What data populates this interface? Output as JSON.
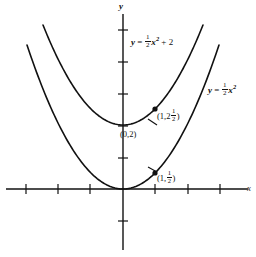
{
  "figure": {
    "background_color": "#ffffff",
    "ink_color": "#111111"
  },
  "axes": {
    "x_label": "x",
    "y_label": "y",
    "origin_px": [
      123,
      189
    ],
    "unit_px": 32,
    "x_ticks_px": [
      26,
      58,
      90,
      155,
      188,
      220
    ],
    "y_ticks_px": [
      30,
      62,
      94,
      126,
      158,
      221
    ],
    "x_axis_y_px": 189,
    "y_axis_x_px": 123
  },
  "equations": {
    "upper": {
      "lhs": "y",
      "equals": "=",
      "coef_num": "1",
      "coef_den": "2",
      "variable": "x",
      "power": "2",
      "plus": "+",
      "constant": "2",
      "plain": "y = 1/2 x^2 + 2"
    },
    "lower": {
      "lhs": "y",
      "equals": "=",
      "coef_num": "1",
      "coef_den": "2",
      "variable": "x",
      "power": "2",
      "plain": "y = 1/2 x^2"
    }
  },
  "point_labels": {
    "vertex_upper": "(0,2)",
    "point_upper_open": "(1,2",
    "point_upper_num": "1",
    "point_upper_den": "2",
    "point_upper_close": ")",
    "point_upper_plain": "(1, 2 1/2)",
    "point_lower_open": "(1,",
    "point_lower_num": "1",
    "point_lower_den": "2",
    "point_lower_close": ")",
    "point_lower_plain": "(1, 1/2)"
  },
  "markers": [
    {
      "name": "point-on-upper-parabola",
      "x": 1,
      "y": 2.5,
      "px": [
        155,
        126
      ]
    },
    {
      "name": "point-on-lower-parabola",
      "x": 1,
      "y": 0.5,
      "px": [
        155,
        173
      ]
    }
  ],
  "chart_data": {
    "type": "line",
    "title": "",
    "xlabel": "x",
    "ylabel": "y",
    "xlim": [
      -3.1,
      3.1
    ],
    "ylim": [
      -2.5,
      5.2
    ],
    "grid": false,
    "legend": "inline-annotations",
    "series": [
      {
        "name": "y = 1/2 x^2 + 2",
        "label": "y = ½x² + 2",
        "formula": "0.5*x^2 + 2",
        "x": [
          -2.5,
          -2.0,
          -1.5,
          -1.0,
          -0.5,
          0.0,
          0.5,
          1.0,
          1.5,
          2.0,
          2.5
        ],
        "y": [
          5.125,
          4.0,
          3.125,
          2.5,
          2.125,
          2.0,
          2.125,
          2.5,
          3.125,
          4.0,
          5.125
        ],
        "vertex": [
          0,
          2
        ],
        "annotated_points": [
          {
            "label": "(0,2)",
            "x": 0,
            "y": 2
          },
          {
            "label": "(1,2½)",
            "x": 1,
            "y": 2.5
          }
        ]
      },
      {
        "name": "y = 1/2 x^2",
        "label": "y = ½x²",
        "formula": "0.5*x^2",
        "x": [
          -3.0,
          -2.5,
          -2.0,
          -1.5,
          -1.0,
          -0.5,
          0.0,
          0.5,
          1.0,
          1.5,
          2.0,
          2.5,
          3.0
        ],
        "y": [
          4.5,
          3.125,
          2.0,
          1.125,
          0.5,
          0.125,
          0.0,
          0.125,
          0.5,
          1.125,
          2.0,
          3.125,
          4.5
        ],
        "vertex": [
          0,
          0
        ],
        "annotated_points": [
          {
            "label": "(1,½)",
            "x": 1,
            "y": 0.5
          }
        ]
      }
    ]
  }
}
